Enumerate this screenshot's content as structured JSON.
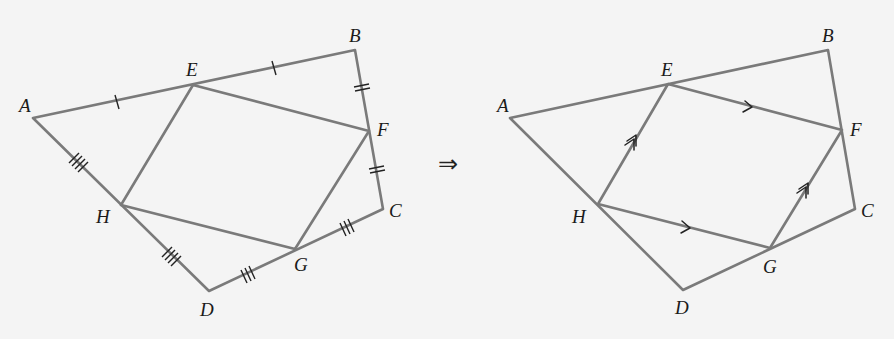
{
  "figure": {
    "left": {
      "title": "Quadrilateral ABCD with midpoints E, F, G, H",
      "vertices": {
        "A": {
          "label": "A",
          "x": 33,
          "y": 118
        },
        "B": {
          "label": "B",
          "x": 355,
          "y": 50
        },
        "C": {
          "label": "C",
          "x": 383,
          "y": 209
        },
        "D": {
          "label": "D",
          "x": 209,
          "y": 291
        },
        "E": {
          "label": "E",
          "x": 193,
          "y": 85
        },
        "F": {
          "label": "F",
          "x": 369,
          "y": 131
        },
        "G": {
          "label": "G",
          "x": 295,
          "y": 249
        },
        "H": {
          "label": "H",
          "x": 121,
          "y": 205
        }
      },
      "tick_marks": [
        {
          "segment": "AE",
          "count": 1
        },
        {
          "segment": "EB",
          "count": 1
        },
        {
          "segment": "BF",
          "count": 2
        },
        {
          "segment": "FC",
          "count": 2
        },
        {
          "segment": "CG",
          "count": 3
        },
        {
          "segment": "GD",
          "count": 3
        },
        {
          "segment": "AH",
          "count": 4
        },
        {
          "segment": "HD",
          "count": 4
        }
      ]
    },
    "implies_symbol": "⇒",
    "right": {
      "title": "EFGH is a parallelogram",
      "vertices": {
        "A": {
          "label": "A",
          "x": 510,
          "y": 118
        },
        "B": {
          "label": "B",
          "x": 828,
          "y": 50
        },
        "C": {
          "label": "C",
          "x": 855,
          "y": 209
        },
        "D": {
          "label": "D",
          "x": 683,
          "y": 290
        },
        "E": {
          "label": "E",
          "x": 668,
          "y": 84
        },
        "F": {
          "label": "F",
          "x": 842,
          "y": 130
        },
        "G": {
          "label": "G",
          "x": 770,
          "y": 248
        },
        "H": {
          "label": "H",
          "x": 598,
          "y": 204
        }
      },
      "parallel_marks": [
        {
          "segment": "EF",
          "arrows": 1
        },
        {
          "segment": "HG",
          "arrows": 1
        },
        {
          "segment": "HE",
          "arrows": 2
        },
        {
          "segment": "GF",
          "arrows": 2
        }
      ]
    },
    "colors": {
      "background": "#f4f4f4",
      "line": "#7a7a7a",
      "marks": "#222222",
      "label": "#1a1a1a"
    }
  }
}
